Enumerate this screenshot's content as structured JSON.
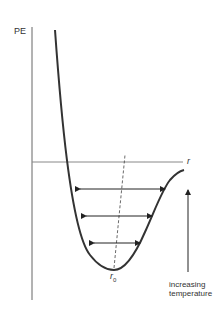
{
  "diagram": {
    "y_axis_label": "PE",
    "x_axis_label": "r",
    "equilibrium_label": "r",
    "equilibrium_subscript": "0",
    "annotation": [
      "increasing",
      "temperature"
    ],
    "colors": {
      "curve": "#333333",
      "axis": "#555555",
      "background": "#ffffff"
    }
  }
}
